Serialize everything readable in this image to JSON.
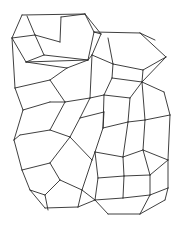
{
  "diagram": {
    "type": "wireframe-framework",
    "width": 181,
    "height": 231,
    "stroke_color": "#2a2a2a",
    "background_color": "#ffffff",
    "edges": [
      [
        22,
        15,
        85,
        14
      ],
      [
        22,
        15,
        12,
        38
      ],
      [
        85,
        14,
        94,
        32
      ],
      [
        12,
        38,
        26,
        62
      ],
      [
        94,
        32,
        88,
        60
      ],
      [
        26,
        62,
        88,
        60
      ],
      [
        27,
        16,
        35,
        35
      ],
      [
        35,
        35,
        12,
        38
      ],
      [
        35,
        35,
        60,
        42
      ],
      [
        60,
        42,
        61,
        17
      ],
      [
        35,
        35,
        44,
        55
      ],
      [
        44,
        55,
        88,
        60
      ],
      [
        44,
        55,
        26,
        62
      ],
      [
        61,
        17,
        85,
        14
      ],
      [
        85,
        14,
        101,
        34
      ],
      [
        101,
        34,
        94,
        32
      ],
      [
        94,
        32,
        140,
        33
      ],
      [
        140,
        33,
        155,
        40
      ],
      [
        101,
        34,
        92,
        55
      ],
      [
        92,
        55,
        88,
        60
      ],
      [
        108,
        38,
        113,
        64
      ],
      [
        140,
        33,
        166,
        57
      ],
      [
        166,
        57,
        143,
        70
      ],
      [
        143,
        70,
        113,
        64
      ],
      [
        113,
        64,
        92,
        55
      ],
      [
        113,
        64,
        112,
        78
      ],
      [
        143,
        70,
        142,
        82
      ],
      [
        112,
        78,
        142,
        82
      ],
      [
        142,
        82,
        166,
        57
      ],
      [
        142,
        82,
        164,
        92
      ],
      [
        164,
        92,
        170,
        115
      ],
      [
        170,
        115,
        145,
        120
      ],
      [
        145,
        120,
        142,
        82
      ],
      [
        112,
        78,
        104,
        95
      ],
      [
        104,
        95,
        130,
        98
      ],
      [
        130,
        98,
        142,
        82
      ],
      [
        130,
        98,
        128,
        122
      ],
      [
        128,
        122,
        145,
        120
      ],
      [
        128,
        122,
        103,
        128
      ],
      [
        103,
        128,
        104,
        95
      ],
      [
        103,
        128,
        95,
        152
      ],
      [
        95,
        152,
        123,
        157
      ],
      [
        123,
        157,
        128,
        122
      ],
      [
        123,
        157,
        143,
        150
      ],
      [
        143,
        150,
        145,
        120
      ],
      [
        143,
        150,
        168,
        160
      ],
      [
        168,
        160,
        170,
        115
      ],
      [
        123,
        157,
        124,
        176
      ],
      [
        124,
        176,
        150,
        175
      ],
      [
        150,
        175,
        143,
        150
      ],
      [
        150,
        175,
        168,
        160
      ],
      [
        95,
        152,
        98,
        178
      ],
      [
        98,
        178,
        124,
        176
      ],
      [
        98,
        178,
        95,
        200
      ],
      [
        95,
        200,
        123,
        198
      ],
      [
        123,
        198,
        124,
        176
      ],
      [
        123,
        198,
        150,
        195
      ],
      [
        150,
        195,
        150,
        175
      ],
      [
        150,
        195,
        168,
        188
      ],
      [
        168,
        188,
        168,
        160
      ],
      [
        95,
        200,
        108,
        214
      ],
      [
        108,
        214,
        140,
        214
      ],
      [
        140,
        214,
        150,
        195
      ],
      [
        140,
        214,
        165,
        200
      ],
      [
        165,
        200,
        168,
        188
      ],
      [
        88,
        60,
        67,
        68
      ],
      [
        67,
        68,
        26,
        62
      ],
      [
        67,
        68,
        50,
        80
      ],
      [
        50,
        80,
        15,
        88
      ],
      [
        15,
        88,
        12,
        38
      ],
      [
        50,
        80,
        65,
        102
      ],
      [
        65,
        102,
        90,
        98
      ],
      [
        90,
        98,
        92,
        55
      ],
      [
        90,
        98,
        104,
        95
      ],
      [
        15,
        88,
        23,
        110
      ],
      [
        23,
        110,
        50,
        102
      ],
      [
        50,
        102,
        65,
        102
      ],
      [
        23,
        110,
        14,
        140
      ],
      [
        65,
        102,
        50,
        130
      ],
      [
        50,
        130,
        20,
        135
      ],
      [
        20,
        135,
        14,
        140
      ],
      [
        50,
        130,
        70,
        137
      ],
      [
        70,
        137,
        80,
        118
      ],
      [
        80,
        118,
        90,
        98
      ],
      [
        80,
        118,
        104,
        112
      ],
      [
        104,
        112,
        103,
        128
      ],
      [
        70,
        137,
        92,
        160
      ],
      [
        92,
        160,
        95,
        152
      ],
      [
        92,
        160,
        82,
        190
      ],
      [
        14,
        140,
        22,
        170
      ],
      [
        22,
        170,
        50,
        163
      ],
      [
        50,
        163,
        70,
        137
      ],
      [
        22,
        170,
        30,
        190
      ],
      [
        50,
        163,
        60,
        180
      ],
      [
        60,
        180,
        82,
        190
      ],
      [
        60,
        180,
        45,
        195
      ],
      [
        45,
        195,
        30,
        190
      ],
      [
        30,
        190,
        45,
        208
      ],
      [
        45,
        208,
        78,
        207
      ],
      [
        78,
        207,
        82,
        190
      ],
      [
        45,
        195,
        48,
        210
      ],
      [
        82,
        190,
        95,
        200
      ],
      [
        78,
        207,
        95,
        200
      ]
    ]
  }
}
